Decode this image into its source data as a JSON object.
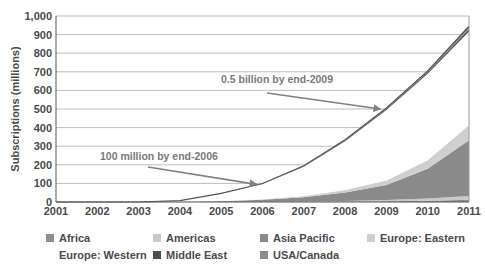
{
  "chart_data": {
    "type": "area",
    "stacked": true,
    "title": "",
    "xlabel": "",
    "ylabel": "Subscriptions (millions)",
    "x": [
      2001,
      2002,
      2003,
      2004,
      2005,
      2006,
      2007,
      2008,
      2009,
      2010,
      2011
    ],
    "x_tick_labels": [
      "2001",
      "2002",
      "2003",
      "2004",
      "2005",
      "2006",
      "2007",
      "2008",
      "2009",
      "2010",
      "2011"
    ],
    "ylim": [
      0,
      1000
    ],
    "y_ticks": [
      0,
      100,
      200,
      300,
      400,
      500,
      600,
      700,
      800,
      900,
      1000
    ],
    "y_tick_labels": [
      "0",
      "100",
      "200",
      "300",
      "400",
      "500",
      "600",
      "700",
      "800",
      "900",
      "1,000"
    ],
    "grid": true,
    "legend_position": "bottom",
    "series": [
      {
        "name": "Africa",
        "color": "#8e8e8e",
        "values": [
          0,
          0,
          0,
          0,
          0,
          0.5,
          1,
          2,
          4,
          7,
          12
        ]
      },
      {
        "name": "Americas",
        "color": "#c9c9c9",
        "values": [
          0,
          0,
          0,
          0,
          0.5,
          1,
          2,
          4,
          7,
          12,
          20
        ]
      },
      {
        "name": "Asia Pacific",
        "color": "#8a8a8a",
        "values": [
          0,
          0,
          0,
          1,
          4,
          10,
          22,
          45,
          80,
          160,
          300
        ]
      },
      {
        "name": "Europe: Eastern",
        "color": "#cfcfcf",
        "values": [
          0,
          0,
          0,
          0,
          1,
          3,
          7,
          14,
          25,
          45,
          80
        ]
      },
      {
        "name": "Europe: Western",
        "color": "#ffffff",
        "values": [
          0,
          0,
          0,
          6,
          40,
          82,
          158,
          262,
          378,
          465,
          505
        ]
      },
      {
        "name": "Middle East",
        "color": "#4d4d4d",
        "values": [
          0,
          0,
          0,
          0,
          0.5,
          1.5,
          2.5,
          4,
          6,
          8,
          12
        ]
      },
      {
        "name": "USA/Canada",
        "color": "#8c8c8c",
        "values": [
          0,
          0,
          0,
          0,
          0.5,
          1.5,
          2.5,
          4,
          5,
          8,
          16
        ]
      }
    ],
    "annotations": [
      {
        "text": "0.5 billion by end-2009",
        "points_to": {
          "x": 2009,
          "y": 505
        }
      },
      {
        "text": "100 million by end-2006",
        "points_to": {
          "x": 2006,
          "y": 100
        }
      }
    ]
  }
}
